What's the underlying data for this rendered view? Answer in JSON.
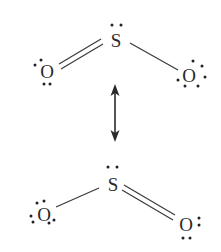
{
  "diagram": {
    "colors": {
      "text": "#2a2a2a",
      "bond": "#3a3a3a",
      "background": "#ffffff"
    },
    "top_structure": {
      "sulfur": {
        "symbol": "S",
        "lone_pairs": 1
      },
      "left_oxygen": {
        "symbol": "O",
        "bond_to_sulfur": "double",
        "lone_pairs": 2
      },
      "right_oxygen": {
        "symbol": "O",
        "bond_to_sulfur": "single",
        "lone_pairs": 3
      }
    },
    "resonance_arrow": {
      "type": "double-headed",
      "orientation": "vertical"
    },
    "bottom_structure": {
      "sulfur": {
        "symbol": "S",
        "lone_pairs": 1
      },
      "left_oxygen": {
        "symbol": "O",
        "bond_to_sulfur": "single",
        "lone_pairs": 3
      },
      "right_oxygen": {
        "symbol": "O",
        "bond_to_sulfur": "double",
        "lone_pairs": 2
      }
    }
  }
}
